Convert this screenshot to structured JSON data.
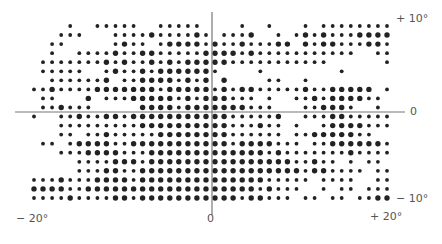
{
  "chart_data": {
    "type": "scatter",
    "title": "",
    "x_range_deg": [
      -20,
      20
    ],
    "y_range_deg": [
      -10,
      10
    ],
    "axis_labels": {
      "y_top": "+ 10°",
      "y_zero": "0",
      "y_bottom": "− 10°",
      "x_left": "− 20°",
      "x_zero": "0",
      "x_right": "+ 20°"
    },
    "ink_color": "#222222",
    "axis_color": "#777777",
    "grid_cols": 40,
    "grid_rows": 20,
    "rows": [
      "0000100111110011111000010010001011111111",
      "0001110001111211112101112001012121112222",
      "0011000001211012222121121112202122111221",
      "0010011112112211111222212111111111110011",
      "0111111121211212122222111111111110000001",
      "0111110012112122222210000100000000100000",
      "0011111120112222121202000011001000000000",
      "1121111222222212222212122111112112222201",
      "0110002011122222121222111010011212222110",
      "0112111000002222122222221110001122210010",
      "1001121122122222222222111112001112211111",
      "0001111111112222222222111211010012222111",
      "0001101121111122222222111111011222221100",
      "0110122221122222222222122221110112222221",
      "0001112222111222222222222212111111121111",
      "0000011112221222222222222222211211010110",
      "0000011122112222222222222222221221111011",
      "1112111222212222222222222211111011110011",
      "2222112222222222222222222121110010110111",
      "1111211112212222222222212211101101101122"
    ]
  }
}
